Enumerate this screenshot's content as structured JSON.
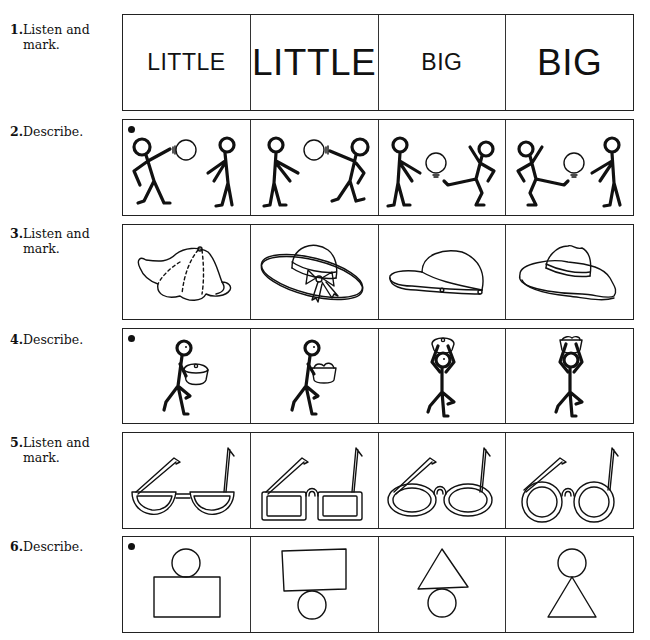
{
  "exercises": [
    {
      "number": "1.",
      "instruction": "Listen and mark.",
      "has_dot": false,
      "cells": [
        {
          "text": "LITTLE",
          "size": "small"
        },
        {
          "text": "LITTLE",
          "size": "large"
        },
        {
          "text": "BIG",
          "size": "small"
        },
        {
          "text": "BIG",
          "size": "large"
        }
      ]
    },
    {
      "number": "2.",
      "instruction": "Describe.",
      "has_dot": true,
      "cells": [
        {
          "image": "stick-figure-throwing-ball-right"
        },
        {
          "image": "stick-figure-throwing-ball-left"
        },
        {
          "image": "stick-figure-kicking-ball-left"
        },
        {
          "image": "stick-figure-kicking-ball-right"
        }
      ]
    },
    {
      "number": "3.",
      "instruction": "Listen and mark.",
      "has_dot": false,
      "cells": [
        {
          "image": "baseball-cap"
        },
        {
          "image": "sun-hat-with-bow"
        },
        {
          "image": "small-cap"
        },
        {
          "image": "wide-brim-hat"
        }
      ]
    },
    {
      "number": "4.",
      "instruction": "Describe.",
      "has_dot": true,
      "cells": [
        {
          "image": "figure-carrying-covered-pot"
        },
        {
          "image": "figure-carrying-full-basket"
        },
        {
          "image": "figure-pot-on-head"
        },
        {
          "image": "figure-basket-on-head"
        }
      ]
    },
    {
      "number": "5.",
      "instruction": "Listen and mark.",
      "has_dot": false,
      "cells": [
        {
          "image": "half-moon-glasses"
        },
        {
          "image": "square-glasses"
        },
        {
          "image": "oval-glasses"
        },
        {
          "image": "round-glasses"
        }
      ]
    },
    {
      "number": "6.",
      "instruction": "Describe.",
      "has_dot": true,
      "cells": [
        {
          "image": "circle-on-rectangle"
        },
        {
          "image": "rectangle-on-circle"
        },
        {
          "image": "triangle-on-circle"
        },
        {
          "image": "circle-on-triangle"
        }
      ]
    }
  ]
}
